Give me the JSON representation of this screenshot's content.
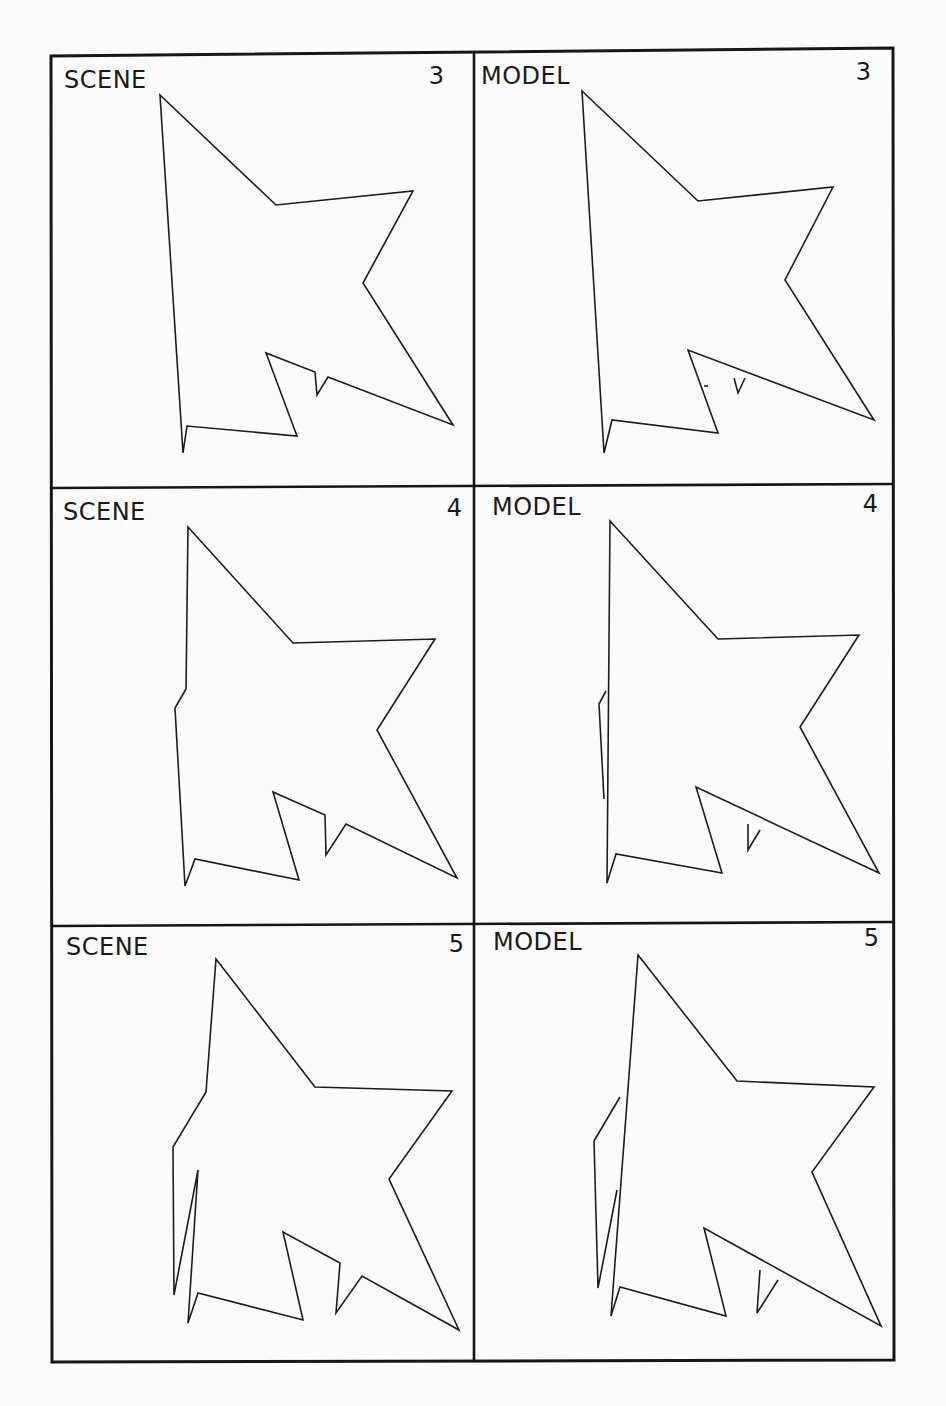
{
  "figure": {
    "layout": {
      "rows": 3,
      "cols": 2
    },
    "panels": [
      {
        "id": "scene-3",
        "label": "SCENE",
        "number": "3",
        "kind": "scene",
        "outline": [
          [
            160,
            95
          ],
          [
            276,
            205
          ],
          [
            413,
            191
          ],
          [
            363,
            283
          ],
          [
            453,
            425
          ],
          [
            328,
            377
          ],
          [
            317,
            395
          ],
          [
            315,
            372
          ],
          [
            266,
            353
          ],
          [
            297,
            436
          ],
          [
            187,
            426
          ],
          [
            183,
            453
          ]
        ],
        "fragments": []
      },
      {
        "id": "model-3",
        "label": "MODEL",
        "number": "3",
        "kind": "model",
        "outline": [
          [
            582,
            91
          ],
          [
            698,
            201
          ],
          [
            833,
            187
          ],
          [
            785,
            280
          ],
          [
            874,
            420
          ],
          [
            688,
            350
          ],
          [
            718,
            433
          ],
          [
            612,
            420
          ],
          [
            604,
            453
          ]
        ],
        "fragments": [
          [
            [
              734,
              378
            ],
            [
              738,
              393
            ],
            [
              745,
              378
            ]
          ],
          [
            [
              704,
              386
            ],
            [
              708,
              386
            ]
          ]
        ]
      },
      {
        "id": "scene-4",
        "label": "SCENE",
        "number": "4",
        "kind": "scene",
        "outline": [
          [
            188,
            527
          ],
          [
            293,
            643
          ],
          [
            435,
            639
          ],
          [
            377,
            730
          ],
          [
            457,
            878
          ],
          [
            346,
            824
          ],
          [
            326,
            855
          ],
          [
            325,
            815
          ],
          [
            273,
            792
          ],
          [
            299,
            880
          ],
          [
            195,
            859
          ],
          [
            185,
            886
          ],
          [
            175,
            708
          ],
          [
            186,
            689
          ]
        ],
        "fragments": []
      },
      {
        "id": "model-4",
        "label": "MODEL",
        "number": "4",
        "kind": "model",
        "outline": [
          [
            610,
            521
          ],
          [
            718,
            639
          ],
          [
            859,
            635
          ],
          [
            800,
            727
          ],
          [
            879,
            873
          ],
          [
            696,
            787
          ],
          [
            722,
            873
          ],
          [
            616,
            854
          ],
          [
            607,
            883
          ]
        ],
        "fragments": [
          [
            [
              606,
              691
            ],
            [
              599,
              704
            ],
            [
              604,
              799
            ]
          ],
          [
            [
              748,
              824
            ],
            [
              748,
              850
            ],
            [
              760,
              830
            ]
          ]
        ]
      },
      {
        "id": "scene-5",
        "label": "SCENE",
        "number": "5",
        "kind": "scene",
        "outline": [
          [
            216,
            959
          ],
          [
            315,
            1087
          ],
          [
            452,
            1091
          ],
          [
            389,
            1179
          ],
          [
            459,
            1330
          ],
          [
            362,
            1276
          ],
          [
            336,
            1313
          ],
          [
            340,
            1263
          ],
          [
            283,
            1232
          ],
          [
            303,
            1320
          ],
          [
            198,
            1293
          ],
          [
            188,
            1323
          ],
          [
            198,
            1170
          ],
          [
            174,
            1295
          ],
          [
            173,
            1147
          ],
          [
            206,
            1092
          ]
        ],
        "fragments": []
      },
      {
        "id": "model-5",
        "label": "MODEL",
        "number": "5",
        "kind": "model",
        "outline": [
          [
            638,
            955
          ],
          [
            737,
            1081
          ],
          [
            874,
            1087
          ],
          [
            812,
            1172
          ],
          [
            881,
            1326
          ],
          [
            704,
            1228
          ],
          [
            726,
            1316
          ],
          [
            620,
            1287
          ],
          [
            611,
            1316
          ]
        ],
        "fragments": [
          [
            [
              620,
              1097
            ],
            [
              594,
              1141
            ],
            [
              598,
              1288
            ],
            [
              617,
              1190
            ]
          ],
          [
            [
              760,
              1270
            ],
            [
              757,
              1313
            ],
            [
              778,
              1280
            ]
          ]
        ]
      }
    ]
  },
  "colors": {
    "ink": "#1c1c1c",
    "paper": "#fbfbfb",
    "bleed_through": "#e6e6e6"
  }
}
